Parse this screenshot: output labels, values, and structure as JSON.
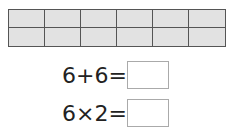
{
  "grid": {
    "rows": 2,
    "columns": 6,
    "fill_color": "#e2e2e2",
    "line_color": "#555555"
  },
  "equations": [
    {
      "expression": "6+6=",
      "answer": ""
    },
    {
      "expression": "6×2=",
      "answer": ""
    }
  ]
}
